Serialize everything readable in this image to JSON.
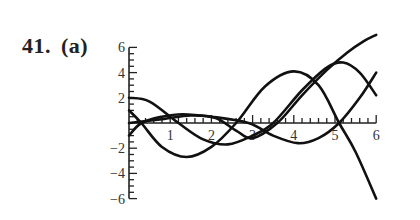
{
  "problem": {
    "number": "41.",
    "part": "(a)"
  },
  "chart_data": {
    "type": "line",
    "title": "",
    "xlabel": "",
    "ylabel": "",
    "xlim": [
      0,
      6
    ],
    "ylim": [
      -6,
      6
    ],
    "grid": false,
    "legend": null,
    "x_ticks": [
      1,
      2,
      3,
      4,
      5,
      6
    ],
    "x_tick_labels": [
      "1",
      "2",
      "3",
      "4",
      "5",
      "6"
    ],
    "y_ticks": [
      -6,
      -4,
      -2,
      2,
      4,
      6
    ],
    "y_tick_labels": [
      "−6",
      "−4",
      "−2",
      "2",
      "4",
      "6"
    ],
    "series": [
      {
        "name": "curve-1",
        "x": [
          0,
          0.3,
          0.8,
          1.4,
          2.0,
          2.6,
          3.3,
          4.0,
          4.6,
          5.1,
          5.5,
          6.0
        ],
        "y": [
          1.0,
          0.0,
          -1.9,
          -2.7,
          -1.9,
          0.0,
          2.9,
          4.1,
          3.0,
          0.0,
          -2.3,
          -6.0
        ]
      },
      {
        "name": "curve-2",
        "x": [
          0,
          0.5,
          1.2,
          1.8,
          2.4,
          3.0,
          3.5,
          4.2,
          4.8,
          5.2,
          5.6,
          6.0
        ],
        "y": [
          2.0,
          1.7,
          0.0,
          -1.3,
          -1.7,
          -1.0,
          0.0,
          2.6,
          4.4,
          4.8,
          4.0,
          2.2
        ]
      },
      {
        "name": "curve-3",
        "x": [
          0,
          0.3,
          0.8,
          1.3,
          2.0,
          2.9,
          3.5,
          4.1,
          4.6,
          5.1,
          5.6,
          6.0
        ],
        "y": [
          -1.0,
          0.0,
          0.5,
          0.7,
          0.5,
          0.0,
          -1.0,
          -1.6,
          -1.2,
          0.0,
          2.0,
          4.0
        ]
      },
      {
        "name": "curve-4",
        "x": [
          0,
          0.8,
          1.5,
          2.1,
          2.6,
          3.0,
          3.6,
          4.2,
          4.8,
          5.3,
          5.7,
          6.0
        ],
        "y": [
          0.0,
          0.3,
          0.6,
          0.4,
          -0.6,
          -1.2,
          0.0,
          2.2,
          4.2,
          5.6,
          6.5,
          7.0
        ]
      }
    ]
  }
}
